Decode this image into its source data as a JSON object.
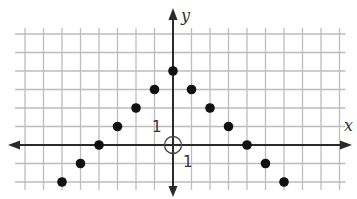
{
  "chart_data": {
    "type": "scatter",
    "title": "",
    "xlabel": "x",
    "ylabel": "y",
    "tick_labels": {
      "x_unit": "1",
      "y_unit": "1"
    },
    "xlim": [
      -8,
      9
    ],
    "ylim": [
      -2,
      6
    ],
    "grid": true,
    "unit_px": 18.5,
    "origin_px": [
      173,
      145
    ],
    "origin_marker": "open-circle",
    "series": [
      {
        "name": "points",
        "points": [
          [
            -6,
            -2
          ],
          [
            -5,
            -1
          ],
          [
            -4,
            0
          ],
          [
            -3,
            1
          ],
          [
            -2,
            2
          ],
          [
            -1,
            3
          ],
          [
            0,
            4
          ],
          [
            1,
            3
          ],
          [
            2,
            2
          ],
          [
            3,
            1
          ],
          [
            4,
            0
          ],
          [
            5,
            -1
          ],
          [
            6,
            -2
          ]
        ]
      }
    ],
    "colors": {
      "grid": "#bdbdbd",
      "axis": "#2a2a2a",
      "point": "#111111"
    }
  }
}
